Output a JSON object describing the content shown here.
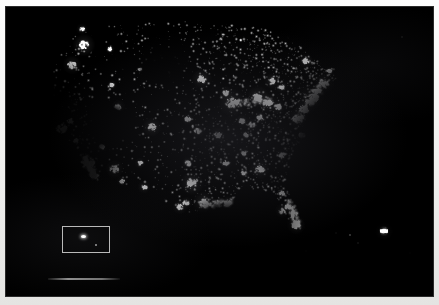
{
  "figure": {
    "kind": "satellite-night-lights-map",
    "region": "Continental United States",
    "background_color": "#000000",
    "light_color": "#ffffff",
    "paper_color": "#f4f4f2"
  },
  "plate": {
    "x": 6,
    "y": 7,
    "width": 427,
    "height": 289
  },
  "inset": {
    "label": "",
    "x": 62,
    "y": 226,
    "width": 48,
    "height": 27,
    "border_color": "#b9b9b9"
  },
  "scale_bar": {
    "label": "",
    "x": 48,
    "y": 278,
    "width": 72,
    "color": "#a8a8a8"
  },
  "caption": {
    "text": ""
  },
  "chart_data": {
    "type": "scatter",
    "title": "",
    "xlabel": "",
    "ylabel": "",
    "grid": false,
    "legend": "none",
    "xlim": [
      0,
      427
    ],
    "ylim": [
      0,
      289
    ],
    "note": "Brightness of artificial night lights; x/y are plate pixel coordinates, r is glow radius in px, i is normalized intensity 0-1.",
    "metro_clusters": [
      {
        "name": "Seattle-Tacoma",
        "x": 78,
        "y": 38,
        "r": 5.0,
        "i": 0.92
      },
      {
        "name": "Portland",
        "x": 66,
        "y": 58,
        "r": 4.2,
        "i": 0.88
      },
      {
        "name": "Vancouver-BC",
        "x": 76,
        "y": 22,
        "r": 2.6,
        "i": 0.55
      },
      {
        "name": "Spokane",
        "x": 104,
        "y": 42,
        "r": 2.2,
        "i": 0.55
      },
      {
        "name": "Boise",
        "x": 106,
        "y": 78,
        "r": 2.4,
        "i": 0.58
      },
      {
        "name": "San Francisco Bay",
        "x": 56,
        "y": 122,
        "r": 5.6,
        "i": 1.0
      },
      {
        "name": "Sacramento",
        "x": 64,
        "y": 114,
        "r": 3.2,
        "i": 0.72
      },
      {
        "name": "Fresno",
        "x": 70,
        "y": 134,
        "r": 2.6,
        "i": 0.6
      },
      {
        "name": "Los Angeles",
        "x": 82,
        "y": 156,
        "r": 7.0,
        "i": 1.0
      },
      {
        "name": "San Diego",
        "x": 88,
        "y": 168,
        "r": 4.0,
        "i": 0.88
      },
      {
        "name": "Las Vegas",
        "x": 96,
        "y": 140,
        "r": 3.0,
        "i": 0.8
      },
      {
        "name": "Phoenix",
        "x": 108,
        "y": 162,
        "r": 4.4,
        "i": 0.9
      },
      {
        "name": "Tucson",
        "x": 116,
        "y": 174,
        "r": 2.6,
        "i": 0.62
      },
      {
        "name": "Salt Lake City",
        "x": 112,
        "y": 100,
        "r": 3.4,
        "i": 0.8
      },
      {
        "name": "Albuquerque",
        "x": 134,
        "y": 156,
        "r": 2.6,
        "i": 0.62
      },
      {
        "name": "El Paso-Juarez",
        "x": 138,
        "y": 180,
        "r": 3.0,
        "i": 0.72
      },
      {
        "name": "Denver",
        "x": 146,
        "y": 120,
        "r": 4.4,
        "i": 0.92
      },
      {
        "name": "Billings",
        "x": 134,
        "y": 62,
        "r": 1.8,
        "i": 0.45
      },
      {
        "name": "Minneapolis-St Paul",
        "x": 196,
        "y": 72,
        "r": 4.6,
        "i": 0.92
      },
      {
        "name": "Omaha",
        "x": 182,
        "y": 112,
        "r": 3.0,
        "i": 0.72
      },
      {
        "name": "Kansas City",
        "x": 192,
        "y": 124,
        "r": 3.6,
        "i": 0.8
      },
      {
        "name": "Oklahoma City",
        "x": 182,
        "y": 156,
        "r": 3.0,
        "i": 0.72
      },
      {
        "name": "Dallas-Fort Worth",
        "x": 186,
        "y": 176,
        "r": 5.4,
        "i": 1.0
      },
      {
        "name": "Austin",
        "x": 180,
        "y": 196,
        "r": 3.0,
        "i": 0.72
      },
      {
        "name": "San Antonio",
        "x": 174,
        "y": 200,
        "r": 3.4,
        "i": 0.78
      },
      {
        "name": "Houston",
        "x": 198,
        "y": 196,
        "r": 5.2,
        "i": 1.0
      },
      {
        "name": "New Orleans",
        "x": 222,
        "y": 196,
        "r": 3.4,
        "i": 0.82
      },
      {
        "name": "Memphis",
        "x": 220,
        "y": 156,
        "r": 3.0,
        "i": 0.72
      },
      {
        "name": "St Louis",
        "x": 212,
        "y": 128,
        "r": 3.8,
        "i": 0.85
      },
      {
        "name": "Chicago",
        "x": 226,
        "y": 96,
        "r": 6.4,
        "i": 1.0
      },
      {
        "name": "Milwaukee",
        "x": 220,
        "y": 86,
        "r": 3.2,
        "i": 0.76
      },
      {
        "name": "Indianapolis",
        "x": 236,
        "y": 114,
        "r": 3.2,
        "i": 0.76
      },
      {
        "name": "Detroit",
        "x": 252,
        "y": 90,
        "r": 5.0,
        "i": 0.96
      },
      {
        "name": "Cleveland",
        "x": 262,
        "y": 96,
        "r": 4.2,
        "i": 0.9
      },
      {
        "name": "Columbus",
        "x": 254,
        "y": 110,
        "r": 3.0,
        "i": 0.74
      },
      {
        "name": "Cincinnati",
        "x": 246,
        "y": 118,
        "r": 3.0,
        "i": 0.74
      },
      {
        "name": "Louisville",
        "x": 240,
        "y": 128,
        "r": 2.6,
        "i": 0.66
      },
      {
        "name": "Nashville",
        "x": 238,
        "y": 146,
        "r": 3.0,
        "i": 0.72
      },
      {
        "name": "Atlanta",
        "x": 254,
        "y": 162,
        "r": 4.6,
        "i": 0.94
      },
      {
        "name": "Birmingham",
        "x": 238,
        "y": 166,
        "r": 2.6,
        "i": 0.66
      },
      {
        "name": "Charlotte",
        "x": 276,
        "y": 148,
        "r": 3.2,
        "i": 0.78
      },
      {
        "name": "Pittsburgh",
        "x": 272,
        "y": 100,
        "r": 3.6,
        "i": 0.82
      },
      {
        "name": "Buffalo",
        "x": 276,
        "y": 80,
        "r": 2.8,
        "i": 0.7
      },
      {
        "name": "Toronto",
        "x": 266,
        "y": 74,
        "r": 3.6,
        "i": 0.82
      },
      {
        "name": "Washington-Baltimore",
        "x": 292,
        "y": 112,
        "r": 5.2,
        "i": 1.0
      },
      {
        "name": "Philadelphia",
        "x": 298,
        "y": 102,
        "r": 4.8,
        "i": 0.98
      },
      {
        "name": "New York City",
        "x": 306,
        "y": 92,
        "r": 7.2,
        "i": 1.0
      },
      {
        "name": "Hartford",
        "x": 312,
        "y": 84,
        "r": 3.0,
        "i": 0.78
      },
      {
        "name": "Boston",
        "x": 318,
        "y": 76,
        "r": 5.0,
        "i": 0.98
      },
      {
        "name": "Portland-ME",
        "x": 324,
        "y": 64,
        "r": 2.2,
        "i": 0.58
      },
      {
        "name": "Montreal",
        "x": 300,
        "y": 54,
        "r": 3.4,
        "i": 0.78
      },
      {
        "name": "Norfolk-Hampton Roads",
        "x": 296,
        "y": 128,
        "r": 3.2,
        "i": 0.78
      },
      {
        "name": "Jacksonville",
        "x": 276,
        "y": 186,
        "r": 2.8,
        "i": 0.7
      },
      {
        "name": "Orlando",
        "x": 282,
        "y": 200,
        "r": 3.2,
        "i": 0.76
      },
      {
        "name": "Tampa",
        "x": 276,
        "y": 204,
        "r": 3.4,
        "i": 0.8
      },
      {
        "name": "Miami-Ft Lauderdale",
        "x": 290,
        "y": 218,
        "r": 4.4,
        "i": 0.96
      },
      {
        "name": "Bermuda-East-Feature",
        "x": 378,
        "y": 224,
        "r": 4.0,
        "i": 0.96
      }
    ],
    "corridors": [
      {
        "name": "Northeast Corridor",
        "from": [
          292,
          112
        ],
        "to": [
          318,
          76
        ],
        "i": 0.85
      },
      {
        "name": "Southern California",
        "from": [
          78,
          150
        ],
        "to": [
          90,
          170
        ],
        "i": 0.8
      },
      {
        "name": "Great Lakes Arc",
        "from": [
          226,
          96
        ],
        "to": [
          266,
          94
        ],
        "i": 0.7
      },
      {
        "name": "Gulf Coast",
        "from": [
          198,
          198
        ],
        "to": [
          224,
          196
        ],
        "i": 0.6
      },
      {
        "name": "Florida East Coast",
        "from": [
          284,
          196
        ],
        "to": [
          292,
          220
        ],
        "i": 0.7
      }
    ],
    "dark_regions": [
      {
        "name": "Gulf of Mexico",
        "cx": 228,
        "cy": 230,
        "rx": 74,
        "ry": 46
      },
      {
        "name": "Atlantic Ocean",
        "cx": 360,
        "cy": 150,
        "rx": 80,
        "ry": 110
      },
      {
        "name": "Pacific Ocean",
        "cx": 18,
        "cy": 150,
        "rx": 44,
        "ry": 120
      },
      {
        "name": "Great Basin",
        "cx": 104,
        "cy": 118,
        "rx": 22,
        "ry": 26
      },
      {
        "name": "Northern Plains",
        "cx": 156,
        "cy": 60,
        "rx": 28,
        "ry": 22
      }
    ]
  }
}
